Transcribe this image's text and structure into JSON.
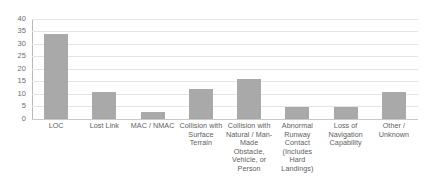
{
  "chart_data": {
    "type": "bar",
    "title": "",
    "subtitle": "",
    "xlabel": "",
    "ylabel": "",
    "ylim": [
      0,
      40
    ],
    "yticks": [
      0,
      5,
      10,
      15,
      20,
      25,
      30,
      35,
      40
    ],
    "ytick_labels": [
      "0",
      "5",
      "10",
      "15",
      "20",
      "25",
      "30",
      "35",
      "40"
    ],
    "grid": true,
    "legend": false,
    "legend_position": "none",
    "bar_color": "#a9a9a9",
    "gridline_color": "#e4e4e4",
    "axis_color": "#b9b9b9",
    "categories": [
      "LOC",
      "Lost Link",
      "MAC / NMAC",
      "Collision with Surface Terrain",
      "Collision with Natural / Man- Made Obstacle, Vehicle, or Person",
      "Abnormal Runway Contact (Includes Hard Landings)",
      "Loss of Navigation Capability",
      "Other / Unknown"
    ],
    "values": [
      34,
      11,
      3,
      12,
      16,
      5,
      5,
      11
    ],
    "series": [
      {
        "name": "Count",
        "values": [
          34,
          11,
          3,
          12,
          16,
          5,
          5,
          11
        ]
      }
    ]
  }
}
